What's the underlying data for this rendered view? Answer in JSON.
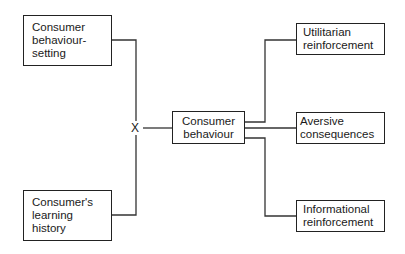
{
  "diagram": {
    "inputs": [
      {
        "id": "behaviour-setting",
        "lines": [
          "Consumer",
          "behaviour-",
          "setting"
        ]
      },
      {
        "id": "learning-history",
        "lines": [
          "Consumer's",
          "learning",
          "history"
        ]
      }
    ],
    "interaction_symbol": "X",
    "center": {
      "id": "consumer-behaviour",
      "lines": [
        "Consumer",
        "behaviour"
      ]
    },
    "outcomes": [
      {
        "id": "utilitarian-reinforcement",
        "lines": [
          "Utilitarian",
          "reinforcement"
        ]
      },
      {
        "id": "aversive-consequences",
        "lines": [
          "Aversive",
          "consequences"
        ]
      },
      {
        "id": "informational-reinforcement",
        "lines": [
          "Informational",
          "reinforcement"
        ]
      }
    ],
    "colors": {
      "stroke": "#222222",
      "background": "#ffffff",
      "text": "#1a1a1a"
    }
  }
}
